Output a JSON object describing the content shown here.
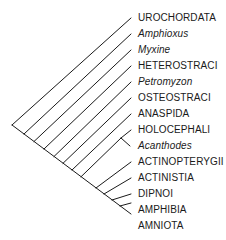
{
  "diagram": {
    "type": "cladogram",
    "line_color": "#1a1a1a",
    "root": [
      12,
      125
    ],
    "spine_end": [
      131,
      214
    ],
    "taxa": [
      {
        "label": "UROCHORDATA",
        "italic": false,
        "tip_y": 18
      },
      {
        "label": "Amphioxus",
        "italic": true,
        "tip_y": 34
      },
      {
        "label": "Myxine",
        "italic": true,
        "tip_y": 50
      },
      {
        "label": "HETEROSTRACI",
        "italic": false,
        "tip_y": 66
      },
      {
        "label": "Petromyzon",
        "italic": true,
        "tip_y": 82
      },
      {
        "label": "OSTEOSTRACI",
        "italic": false,
        "tip_y": 98
      },
      {
        "label": "ANASPIDA",
        "italic": false,
        "tip_y": 114
      },
      {
        "label": "HOLOCEPHALI",
        "italic": false,
        "tip_y": 130
      },
      {
        "label": "Acanthodes",
        "italic": true,
        "tip_y": 146
      },
      {
        "label": "ACTINOPTERYGII",
        "italic": false,
        "tip_y": 162
      },
      {
        "label": "ACTINISTIA",
        "italic": false,
        "tip_y": 178
      },
      {
        "label": "DIPNOI",
        "italic": false,
        "tip_y": 194
      },
      {
        "label": "AMPHIBIA",
        "italic": false,
        "tip_y": 210
      },
      {
        "label": "AMNIOTA",
        "italic": false,
        "tip_y": 214
      }
    ]
  },
  "labels": {
    "t0": "UROCHORDATA",
    "t1": "Amphioxus",
    "t2": "Myxine",
    "t3": "HETEROSTRACI",
    "t4": "Petromyzon",
    "t5": "OSTEOSTRACI",
    "t6": "ANASPIDA",
    "t7": "HOLOCEPHALI",
    "t8": "Acanthodes",
    "t9": "ACTINOPTERYGII",
    "t10": "ACTINISTIA",
    "t11": "DIPNOI",
    "t12": "AMPHIBIA",
    "t13": "AMNIOTA"
  }
}
